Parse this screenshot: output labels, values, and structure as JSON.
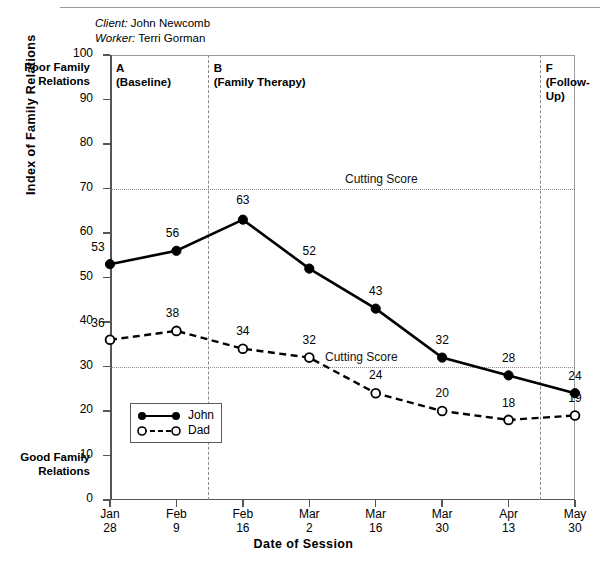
{
  "header": {
    "ghost_line": "",
    "client_label": "Client:",
    "client_name": "John Newcomb",
    "worker_label": "Worker:",
    "worker_name": "Terri Gorman"
  },
  "annotations": {
    "poor_note": "Poor Family\nRelations",
    "good_note": "Good Family\nRelations",
    "phases": [
      {
        "letter": "A",
        "name": "(Baseline)"
      },
      {
        "letter": "B",
        "name": "(Family Therapy)"
      },
      {
        "letter": "F",
        "name": "(Follow-\nUp)"
      }
    ],
    "cutting_score_label": "Cutting Score"
  },
  "chart_data": {
    "type": "line",
    "title": "",
    "xlabel": "Date of Session",
    "ylabel": "Index of Family Relations",
    "ylim": [
      0,
      100
    ],
    "ytick_step": 10,
    "yticks": [
      0,
      10,
      20,
      30,
      40,
      50,
      60,
      70,
      80,
      90,
      100
    ],
    "grid": false,
    "legend_position": "bottom-left",
    "categories": [
      "Jan\n28",
      "Feb\n9",
      "Feb\n16",
      "Mar\n2",
      "Mar\n16",
      "Mar\n30",
      "Apr\n13",
      "May\n30"
    ],
    "x_tick_labels": [
      {
        "month": "Jan",
        "day": "28"
      },
      {
        "month": "Feb",
        "day": "9"
      },
      {
        "month": "Feb",
        "day": "16"
      },
      {
        "month": "Mar",
        "day": "2"
      },
      {
        "month": "Mar",
        "day": "16"
      },
      {
        "month": "Mar",
        "day": "30"
      },
      {
        "month": "Apr",
        "day": "13"
      },
      {
        "month": "May",
        "day": "30"
      }
    ],
    "series": [
      {
        "name": "John",
        "style": "solid",
        "marker": "filled-circle",
        "values": [
          53,
          56,
          63,
          52,
          43,
          32,
          28,
          24
        ]
      },
      {
        "name": "Dad",
        "style": "dashed",
        "marker": "open-circle",
        "values": [
          36,
          38,
          34,
          32,
          24,
          20,
          18,
          19
        ]
      }
    ],
    "reference_lines": [
      {
        "label": "Cutting Score",
        "value": 70
      },
      {
        "label": "Cutting Score",
        "value": 30
      }
    ],
    "phase_dividers": [
      {
        "after_index": 1,
        "label": "A/B"
      },
      {
        "after_index": 6,
        "label": "B/F"
      }
    ]
  }
}
